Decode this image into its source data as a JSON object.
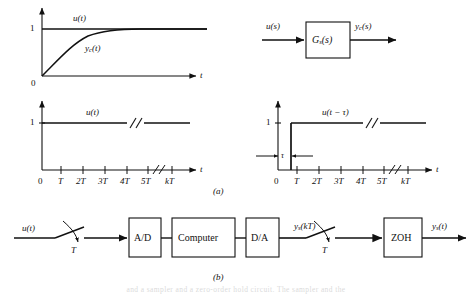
{
  "figure": {
    "part_a_caption": "(a)",
    "part_b_caption": "(b)",
    "page_footer_text": "and a sampler and a zero-order hold circuit. The sampler and the"
  },
  "plot_step_response": {
    "name": "continuous step response plot",
    "y_axis_one": "1",
    "origin_label": "0",
    "x_axis_label": "t",
    "input_curve_label": "u(t)",
    "output_curve_label": "yₑ(t)",
    "output_curve_label_base": "y",
    "output_curve_label_sub": "c",
    "output_curve_label_tail": "(t)"
  },
  "block_gs": {
    "name": "continuous plant block diagram",
    "input_label": "u(s)",
    "output_label_base": "y",
    "output_label_sub": "c",
    "output_label_tail": "(s)",
    "box_label_base": "G",
    "box_label_sub": "s",
    "box_label_tail": "(s)"
  },
  "plot_ut": {
    "name": "sampled unit step u(t) plot",
    "y_axis_one": "1",
    "signal_label": "u(t)",
    "x_axis_label": "t",
    "ticks": [
      "0",
      "T",
      "2T",
      "3T",
      "4T",
      "5T",
      "kT"
    ],
    "break_after_tick": "5T"
  },
  "plot_ut_delayed": {
    "name": "delayed unit step u(t - tau) plot",
    "y_axis_one": "1",
    "signal_label": "u(t − τ)",
    "delay_label": "τ",
    "x_axis_label": "t",
    "ticks": [
      "0",
      "T",
      "2T",
      "3T",
      "4T",
      "5T",
      "kT"
    ],
    "break_after_tick": "5T"
  },
  "digital_system": {
    "name": "digital control system block diagram",
    "input_label": "u(t)",
    "sampler_in_label": "T",
    "sampler_out_label": "T",
    "blocks": [
      {
        "label": "A/D"
      },
      {
        "label": "Computer"
      },
      {
        "label": "D/A"
      },
      {
        "label": "ZOH"
      }
    ],
    "mid_signal_base": "y",
    "mid_signal_sub": "s",
    "mid_signal_tail": "(kT)",
    "output_base": "y",
    "output_sub": "s",
    "output_tail": "(t)"
  }
}
